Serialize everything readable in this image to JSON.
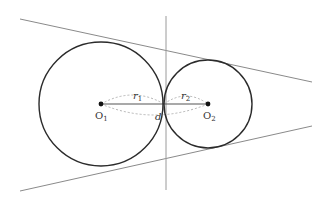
{
  "diagram": {
    "type": "two-tangent-circles",
    "colors": {
      "circle": "#2b2b2b",
      "tangent": "#8a8a8a",
      "dashed": "#b4b4b4",
      "center_segment": "#555555"
    },
    "circle1": {
      "cx": 101,
      "cy": 104,
      "r": 62
    },
    "circle2": {
      "cx": 208,
      "cy": 104,
      "r": 44
    },
    "tangent_top": {
      "x1": 20,
      "y1": 19,
      "x2": 312,
      "y2": 82
    },
    "tangent_bottom": {
      "x1": 20,
      "y1": 191,
      "x2": 312,
      "y2": 126
    },
    "tangent_vertical": {
      "x1": 166,
      "y1": 16,
      "x2": 166,
      "y2": 190
    }
  },
  "labels": {
    "o1": {
      "main": "O",
      "sub": "1"
    },
    "o2": {
      "main": "O",
      "sub": "2"
    },
    "r1": {
      "main": "r",
      "sub": "1"
    },
    "r2": {
      "main": "r",
      "sub": "2"
    },
    "d": "d"
  }
}
